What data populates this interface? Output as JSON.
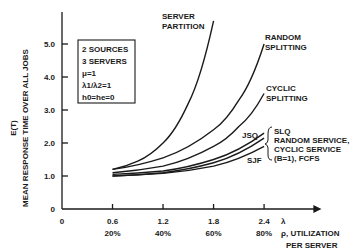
{
  "chart_data": {
    "type": "line",
    "title": "",
    "xlabel": "ρ, UTILIZATION PER SERVER",
    "xlabel_lambda": "λ",
    "ylabel_top": "E(T)",
    "ylabel": "MEAN RESPONSE TIME OVER ALL JOBS",
    "xlim": [
      0,
      2.7
    ],
    "ylim": [
      0,
      6.0
    ],
    "x_ticks": [
      "0",
      "0.6",
      "1.2",
      "1.8",
      "2.4"
    ],
    "x_ticks_pct": [
      "",
      "20%",
      "40%",
      "60%",
      "80%"
    ],
    "y_ticks": [
      "0",
      "1.0",
      "2.0",
      "3.0",
      "4.0",
      "5.0"
    ],
    "grid": false,
    "legend_box": [
      "2 SOURCES",
      "3 SERVERS",
      "μ=1",
      "λ1/λ2=1",
      "h0=he=0"
    ],
    "series": [
      {
        "name": "SERVER PARTITION",
        "x": [
          0.6,
          0.9,
          1.2,
          1.5,
          1.8
        ],
        "values": [
          1.2,
          1.45,
          2.0,
          3.2,
          5.7
        ]
      },
      {
        "name": "RANDOM SPLITTING",
        "x": [
          0.6,
          1.2,
          1.8,
          2.1,
          2.4
        ],
        "values": [
          1.2,
          1.55,
          2.4,
          3.3,
          5.0
        ]
      },
      {
        "name": "CYCLIC SPLITTING",
        "x": [
          0.6,
          1.2,
          1.8,
          2.1,
          2.4
        ],
        "values": [
          1.1,
          1.3,
          1.9,
          2.5,
          3.5
        ]
      },
      {
        "name": "JSQ",
        "x": [
          0.6,
          1.2,
          1.8,
          2.4
        ],
        "values": [
          1.05,
          1.15,
          1.5,
          2.3
        ]
      },
      {
        "name": "SLQ, RANDOM SERVICE, CYCLIC SERVICE (B=1), FCFS",
        "x": [
          0.6,
          1.2,
          1.8,
          2.4
        ],
        "values": [
          1.0,
          1.1,
          1.4,
          2.15
        ]
      },
      {
        "name": "SJF",
        "x": [
          0.6,
          1.2,
          1.8,
          2.4
        ],
        "values": [
          1.0,
          1.08,
          1.3,
          1.9
        ]
      }
    ]
  },
  "labels": {
    "server_partition": [
      "SERVER",
      "PARTITION"
    ],
    "random_splitting": [
      "RANDOM",
      "SPLITTING"
    ],
    "cyclic_splitting": [
      "CYCLIC",
      "SPLITTING"
    ],
    "jsq": "JSQ",
    "slq_group": [
      "SLQ",
      "RANDOM SERVICE,",
      "CYCLIC SERVICE",
      "(B=1), FCFS"
    ],
    "sjf": "SJF"
  }
}
